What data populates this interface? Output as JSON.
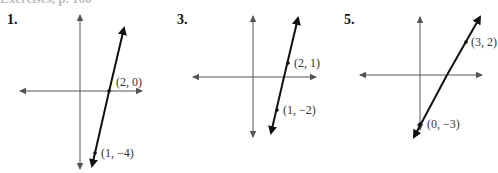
{
  "header": {
    "partial_text": "Exercises, p. 160"
  },
  "panels": [
    {
      "number": "1.",
      "points": [
        {
          "label": "(2, 0)"
        },
        {
          "label": "(1, −4)"
        }
      ]
    },
    {
      "number": "3.",
      "points": [
        {
          "label": "(2, 1)"
        },
        {
          "label": "(1, −2)"
        }
      ]
    },
    {
      "number": "5.",
      "points": [
        {
          "label": "(3, 2)"
        },
        {
          "label": "(0, −3)"
        }
      ]
    }
  ],
  "colors": {
    "axis": "#555555",
    "line": "#111111",
    "text": "#333333"
  }
}
